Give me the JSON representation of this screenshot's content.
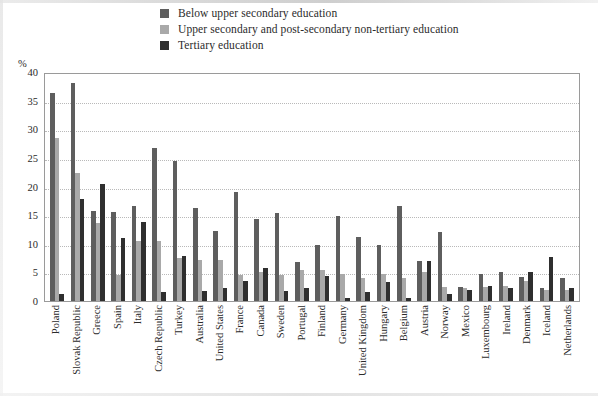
{
  "chart_data": {
    "type": "bar",
    "title": "",
    "xlabel": "",
    "ylabel": "%",
    "ylim": [
      0,
      40
    ],
    "yticks": [
      "0",
      "5",
      "10",
      "15",
      "20",
      "25",
      "30",
      "35",
      "40"
    ],
    "grid": true,
    "legend_position": "top",
    "categories": [
      "Poland",
      "Slovak Republic",
      "Greece",
      "Spain",
      "Italy",
      "Czech Republic",
      "Turkey",
      "Australia",
      "United States",
      "France",
      "Canada",
      "Sweden",
      "Portugal",
      "Finland",
      "Germany",
      "United Kingdom",
      "Hungary",
      "Belgium",
      "Austria",
      "Norway",
      "Mexico",
      "Luxembourg",
      "Ireland",
      "Denmark",
      "Iceland",
      "Netherlands"
    ],
    "series": [
      {
        "name": "Below upper secondary education",
        "color": "#5e5e5e",
        "values": [
          36.3,
          38.0,
          15.8,
          15.6,
          16.6,
          26.8,
          24.5,
          16.2,
          12.3,
          19.0,
          14.3,
          15.3,
          6.9,
          9.7,
          14.8,
          11.2,
          9.8,
          16.6,
          7.0,
          12.0,
          2.4,
          4.7,
          5.1,
          4.2,
          2.2,
          4.0
        ]
      },
      {
        "name": "Upper secondary and post-secondary non-tertiary education",
        "color": "#a9a9a9",
        "values": [
          28.5,
          22.3,
          13.6,
          4.6,
          10.5,
          10.4,
          7.5,
          7.1,
          7.1,
          4.6,
          5.1,
          4.5,
          5.4,
          5.4,
          4.8,
          4.0,
          4.8,
          4.0,
          5.1,
          2.4,
          2.3,
          2.4,
          2.6,
          3.5,
          2.0,
          1.9
        ]
      },
      {
        "name": "Tertiary education",
        "color": "#2f2f2f",
        "values": [
          1.3,
          17.8,
          20.5,
          11.0,
          13.8,
          1.6,
          7.8,
          1.8,
          2.3,
          3.5,
          5.7,
          1.7,
          2.3,
          4.3,
          0.5,
          1.6,
          3.3,
          0.6,
          7.0,
          1.2,
          2.0,
          2.6,
          2.3,
          5.0,
          7.7,
          2.3
        ]
      }
    ]
  },
  "legend": {
    "items": [
      {
        "label": "Below upper secondary education",
        "color": "#5e5e5e"
      },
      {
        "label": "Upper secondary and post-secondary non-tertiary education",
        "color": "#a9a9a9"
      },
      {
        "label": "Tertiary education",
        "color": "#2f2f2f"
      }
    ]
  },
  "axis": {
    "y_unit_label": "%",
    "y_ticks": [
      "40",
      "35",
      "30",
      "25",
      "20",
      "15",
      "10",
      "5",
      "0"
    ]
  }
}
